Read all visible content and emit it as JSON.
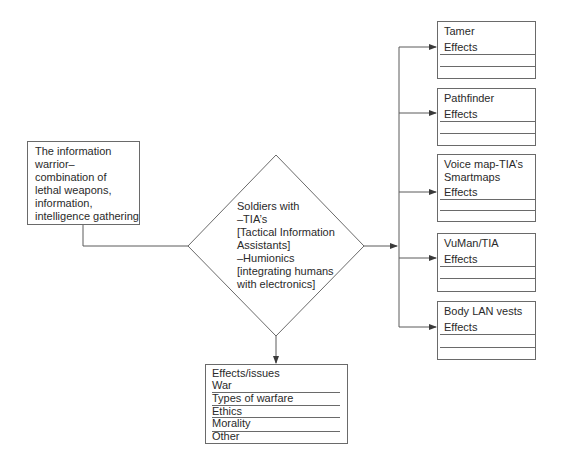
{
  "diagram": {
    "source_node": {
      "lines": [
        "The information",
        "warrior–",
        "combination of",
        "lethal weapons,",
        "information,",
        "intelligence gathering"
      ]
    },
    "center_node": {
      "shape": "diamond",
      "lines": [
        "Soldiers with",
        "–TIA’s",
        "[Tactical Information",
        "Assistants]",
        "–Humionics",
        "[integrating humans",
        "with electronics]"
      ]
    },
    "right_nodes": [
      {
        "title_lines": [
          "Tamer"
        ],
        "effects_label": "Effects"
      },
      {
        "title_lines": [
          "Pathfinder"
        ],
        "effects_label": "Effects"
      },
      {
        "title_lines": [
          "Voice map-TIA’s",
          "Smartmaps"
        ],
        "effects_label": "Effects"
      },
      {
        "title_lines": [
          "VuMan/TIA"
        ],
        "effects_label": "Effects"
      },
      {
        "title_lines": [
          "Body LAN vests"
        ],
        "effects_label": "Effects"
      }
    ],
    "bottom_node": {
      "title": "Effects/issues",
      "items": [
        "War",
        "Types of warfare",
        "Ethics",
        "Morality",
        "Other"
      ]
    },
    "colors": {
      "line": "#5a5a5a",
      "text": "#2a2a2a",
      "background": "#ffffff"
    }
  }
}
